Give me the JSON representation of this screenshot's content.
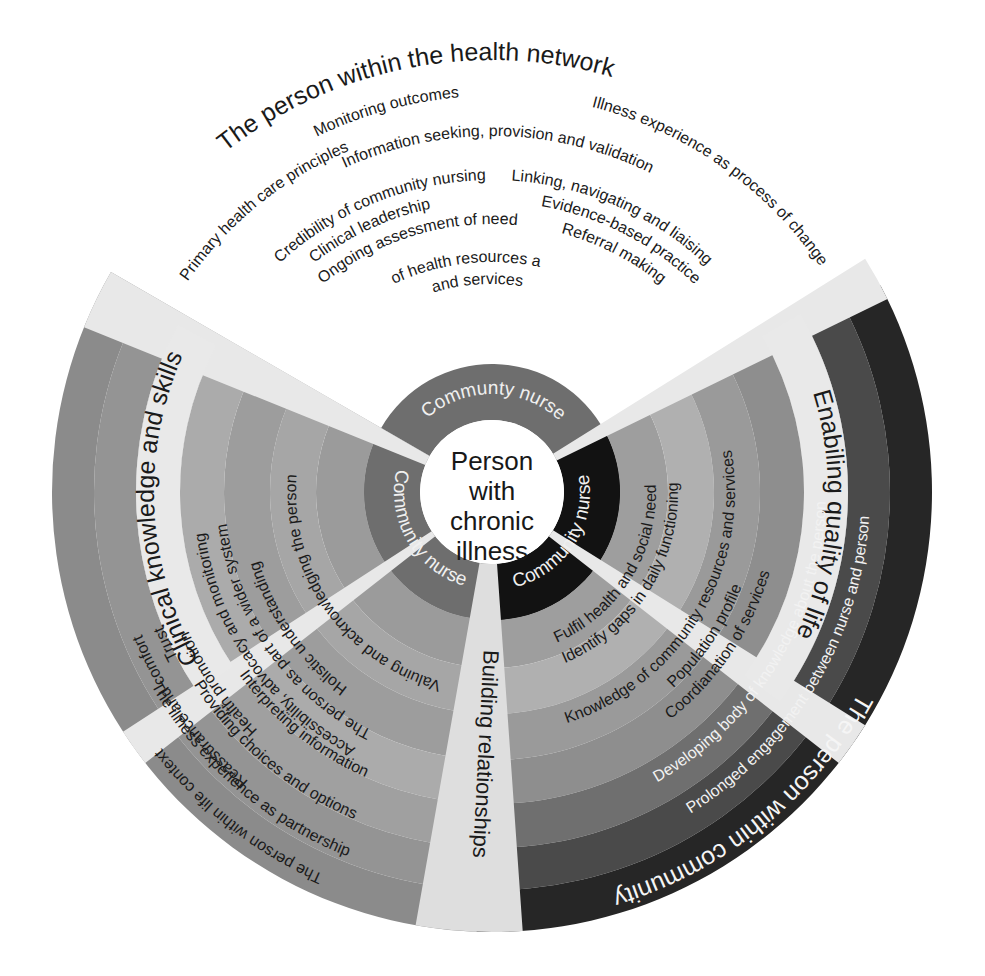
{
  "diagram": {
    "title_core": [
      "Person",
      "with",
      "chronic",
      "illness"
    ],
    "inner_ring_labels": [
      "Communty nurse",
      "Community nurse",
      "Community nurse"
    ],
    "quadrants": [
      {
        "id": "health-network",
        "label": "The person within the health network",
        "position": "top",
        "color": "#a8a8a8",
        "text_color": "#1a1a1a"
      },
      {
        "id": "clinical-knowledge",
        "label": "Clinical knowledge and skills",
        "position": "upper-left",
        "color": "#c9c9c9",
        "text_color": "#1a1a1a"
      },
      {
        "id": "life-context",
        "label": "The person within life context",
        "position": "lower-left",
        "color": "#8f8f8f",
        "text_color": "#1a1a1a"
      },
      {
        "id": "quality-of-life",
        "label": "Enabiling quality of life",
        "position": "upper-right",
        "color": "#b5b5b5",
        "text_color": "#1a1a1a"
      },
      {
        "id": "within-community",
        "label": "The person within community",
        "position": "lower-right",
        "color": "#2b2b2b",
        "text_color": "#f5f5f5"
      }
    ],
    "divider_label": "Building relationships",
    "segments_top": [
      "Illness experience as process of change",
      "Monitoring outcomes",
      "Information seeking, provision and validation",
      "Linking, navigating and liaising",
      "Evidence-based practice",
      "Referral making"
    ],
    "segments_upper_left": [
      "Primary health care principles",
      "Credibility of community nursing",
      "Clinical leadership",
      "Ongoing assessment of needs",
      "Knowledge of health resources and services"
    ],
    "segments_lower_left": [
      "Reassurance and comfort",
      "Trust",
      "Health promotion",
      "Accessibility, advocacy and monitoring",
      "The person as part of a wider system",
      "Holistic understanding",
      "Valuing and acknowledging the person",
      "Interpreting information",
      "Providing choices and options",
      "The illness experience as partnership"
    ],
    "segments_right": [
      "Identify gaps in daily functioning",
      "Fulfil health and social need",
      "Knowledge of community resources and services",
      "Coordianation of services",
      "Population profile",
      "Developing body of knowledge about the person",
      "Prolonged engagement between nurse and person"
    ],
    "palette": {
      "core_fill": "#ffffff",
      "nurse_ring_top": "#6e6e6e",
      "nurse_ring_left": "#6e6e6e",
      "nurse_ring_right": "#121212",
      "divider_fill": "#e2e2e2",
      "page_bg": "#ffffff"
    }
  }
}
